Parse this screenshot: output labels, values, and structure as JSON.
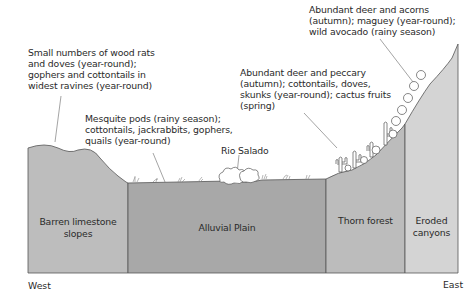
{
  "annotations": {
    "west_slopes": [
      "Small numbers of wood rats",
      "and doves (year-round);",
      "gophers and cottontails in",
      "widest ravines (year-round)"
    ],
    "alluvial": [
      "Mesquite pods (rainy season);",
      "cottontails, jackrabbits, gophers,",
      "quails (year-round)"
    ],
    "river": "Rio Salado",
    "thorn_forest": [
      "Abundant deer and peccary",
      "(autumn); cottontails, doves,",
      "skunks (year-round); cactus fruits",
      "(spring)"
    ],
    "upper_slope": [
      "Abundant deer and acorns",
      "(autumn); maguey (year-round);",
      "wild avocado (rainy season)"
    ]
  },
  "zones": {
    "barren": [
      "Barren limestone",
      "slopes"
    ],
    "alluvial": [
      "Alluvial Plain"
    ],
    "thorn": [
      "Thorn forest"
    ],
    "eroded": [
      "Eroded",
      "canyons"
    ]
  },
  "directions": {
    "west": "West",
    "east": "East"
  },
  "colors": {
    "barren": "#bdbdbd",
    "alluvial": "#a8a8a8",
    "thorn": "#bcbcbc",
    "eroded": "#d4d4d4",
    "outline": "#555555"
  }
}
